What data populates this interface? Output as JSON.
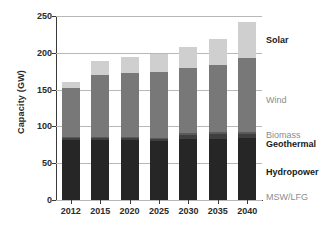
{
  "chart_data": {
    "type": "bar",
    "stacked": true,
    "title": "",
    "xlabel": "",
    "ylabel": "Capacity (GW)",
    "categories": [
      "2012",
      "2015",
      "2020",
      "2025",
      "2030",
      "2035",
      "2040"
    ],
    "ylim": [
      0,
      250
    ],
    "yticks": [
      0,
      50,
      100,
      150,
      200,
      250
    ],
    "grid": true,
    "legend_position": "right-inline",
    "series": [
      {
        "name": "MSW/LFG",
        "color": "#262626",
        "values": [
          3,
          3,
          3,
          3,
          3,
          3,
          3
        ]
      },
      {
        "name": "Hydropower",
        "color": "#262626",
        "values": [
          78,
          78,
          78,
          77,
          80,
          80,
          81
        ]
      },
      {
        "name": "Geothermal",
        "color": "#3f3f3f",
        "values": [
          3,
          3,
          3,
          3,
          6,
          7,
          6
        ]
      },
      {
        "name": "Biomass",
        "color": "#5a5a5a",
        "values": [
          1,
          1,
          1,
          1,
          2,
          2,
          3
        ]
      },
      {
        "name": "Wind",
        "color": "#787878",
        "values": [
          67,
          85,
          88,
          90,
          89,
          92,
          100
        ]
      },
      {
        "name": "Solar",
        "color": "#cfcfcf",
        "values": [
          9,
          19,
          22,
          25,
          28,
          35,
          49
        ]
      }
    ],
    "totals": [
      161,
      189,
      195,
      199,
      208,
      219,
      242
    ],
    "annotations": [
      {
        "label": "Solar",
        "style": "dark"
      },
      {
        "label": "Wind",
        "style": "gray"
      },
      {
        "label": "Biomass",
        "style": "gray"
      },
      {
        "label": "Geothermal",
        "style": "dark"
      },
      {
        "label": "Hydropower",
        "style": "dark"
      },
      {
        "label": "MSW/LFG",
        "style": "gray"
      }
    ]
  },
  "axis": {
    "y_title": "Capacity (GW)",
    "y_ticks": [
      "250",
      "200",
      "150",
      "100",
      "50",
      "0"
    ],
    "x_ticks": [
      "2012",
      "2015",
      "2020",
      "2025",
      "2030",
      "2035",
      "2040"
    ]
  },
  "legend": {
    "solar": "Solar",
    "wind": "Wind",
    "biomass": "Biomass",
    "geothermal": "Geothermal",
    "hydropower": "Hydropower",
    "msw_lfg": "MSW/LFG"
  },
  "colors": {
    "solar": "#cfcfcf",
    "wind": "#787878",
    "biomass": "#5a5a5a",
    "geothermal": "#3f3f3f",
    "hydropower": "#262626",
    "msw_lfg": "#262626",
    "grid": "#b8b8b8",
    "axis": "#3a3a3a",
    "text_dark": "#1a1a1a",
    "text_gray": "#8c8c8c"
  }
}
